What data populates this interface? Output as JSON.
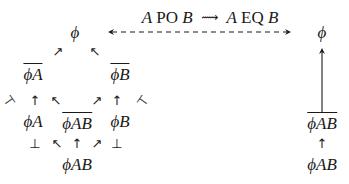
{
  "diagram": {
    "title": {
      "left_text_a": "A",
      "left_text_op": "PO",
      "left_text_b": "B",
      "connector": "⟿",
      "right_text_a": "A",
      "right_text_op": "EQ",
      "right_text_b": "B"
    },
    "left_lattice": {
      "top": "ϕ",
      "not_a": "ϕA",
      "not_b": "ϕB",
      "a": "ϕA",
      "not_ab": "ϕAB",
      "b": "ϕB",
      "bottom": "ϕAB",
      "perp_left": "⊥",
      "perp_right": "⊥",
      "arrow_up": "↑",
      "arrow_ne": "↗",
      "arrow_nw": "↖",
      "tack_left": "⊣",
      "tack_right": "⊢"
    },
    "right_column": {
      "top": "ϕ",
      "not_ab": "ϕAB",
      "bottom": "ϕAB",
      "arrow_up": "↑"
    }
  }
}
